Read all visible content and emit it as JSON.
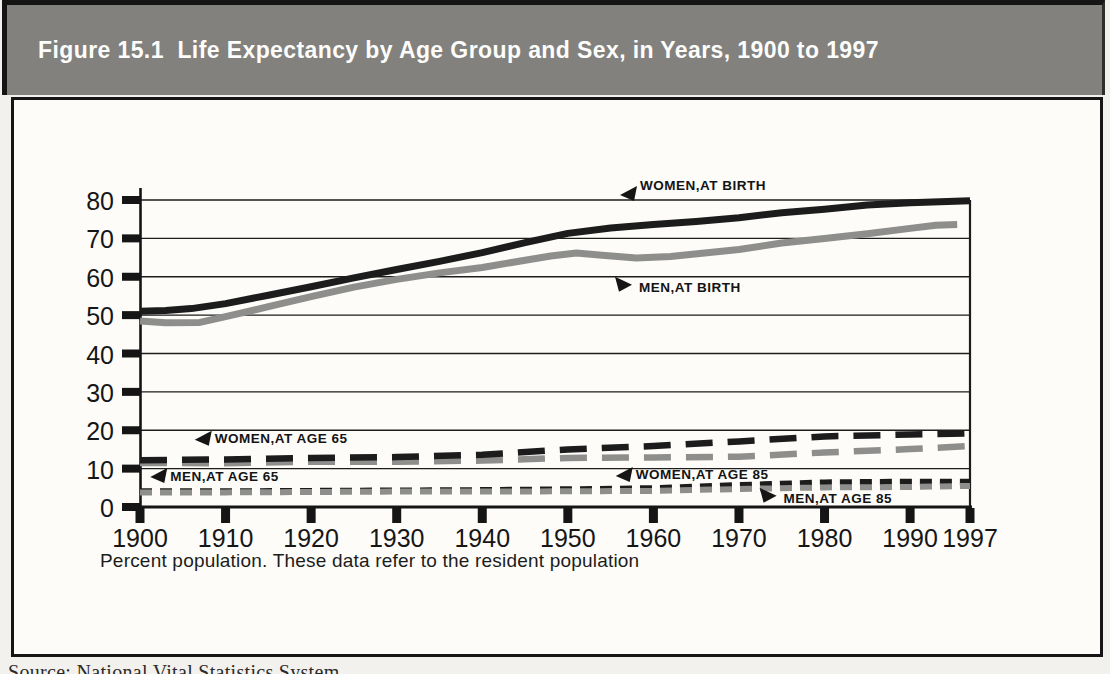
{
  "figure": {
    "title": "Figure 15.1  Life Expectancy by Age Group and Sex, in Years, 1900 to 1997",
    "footnote": "Percent population. These data refer to the resident population",
    "source_caption": "Source: National Vital Statistics System",
    "colors": {
      "band_gray": "#82817e",
      "line_black": "#1c1c1c",
      "line_gray": "#8e8e8c",
      "frame_black": "#151515"
    }
  },
  "chart_data": {
    "type": "line",
    "title": "Life Expectancy by Age Group and Sex, in Years, 1900 to 1997",
    "xlabel": "",
    "ylabel": "",
    "xlim": [
      1900,
      1997
    ],
    "ylim": [
      0,
      80
    ],
    "x_ticks": [
      1900,
      1910,
      1920,
      1930,
      1940,
      1950,
      1960,
      1970,
      1980,
      1990,
      1997
    ],
    "y_ticks": [
      0,
      10,
      20,
      30,
      40,
      50,
      60,
      70,
      80
    ],
    "grid": "horizontal gridlines at every 10 years of life expectancy",
    "legend_position": "inline annotations with arrows",
    "series": [
      {
        "id": "women-at-85",
        "name": "WOMEN,AT AGE 85",
        "color": "black",
        "style": "short-dash",
        "width": 6,
        "points": [
          [
            1900,
            4.1
          ],
          [
            1910,
            4.1
          ],
          [
            1920,
            4.2
          ],
          [
            1930,
            4.3
          ],
          [
            1940,
            4.4
          ],
          [
            1950,
            4.6
          ],
          [
            1960,
            4.9
          ],
          [
            1970,
            5.7
          ],
          [
            1980,
            6.4
          ],
          [
            1990,
            6.6
          ],
          [
            1997,
            6.6
          ]
        ]
      },
      {
        "id": "men-at-85",
        "name": "MEN,AT AGE 85",
        "color": "gray",
        "style": "short-dash",
        "width": 6,
        "points": [
          [
            1900,
            3.8
          ],
          [
            1910,
            3.8
          ],
          [
            1920,
            3.9
          ],
          [
            1930,
            4.0
          ],
          [
            1940,
            4.0
          ],
          [
            1950,
            4.1
          ],
          [
            1960,
            4.2
          ],
          [
            1970,
            4.7
          ],
          [
            1980,
            5.1
          ],
          [
            1990,
            5.2
          ],
          [
            1997,
            5.5
          ]
        ]
      },
      {
        "id": "men-at-65",
        "name": "MEN,AT AGE 65",
        "color": "gray",
        "style": "long-dash",
        "width": 6.5,
        "points": [
          [
            1900,
            11.5
          ],
          [
            1910,
            11.4
          ],
          [
            1920,
            11.8
          ],
          [
            1930,
            11.8
          ],
          [
            1940,
            12.1
          ],
          [
            1950,
            12.8
          ],
          [
            1960,
            12.9
          ],
          [
            1970,
            13.1
          ],
          [
            1980,
            14.2
          ],
          [
            1990,
            15.1
          ],
          [
            1997,
            15.9
          ]
        ]
      },
      {
        "id": "women-at-65",
        "name": "WOMEN,AT AGE 65",
        "color": "black",
        "style": "long-dash",
        "width": 6.5,
        "points": [
          [
            1900,
            12.2
          ],
          [
            1910,
            12.4
          ],
          [
            1920,
            12.8
          ],
          [
            1930,
            13.0
          ],
          [
            1940,
            13.6
          ],
          [
            1950,
            15.0
          ],
          [
            1960,
            15.9
          ],
          [
            1970,
            17.1
          ],
          [
            1980,
            18.4
          ],
          [
            1990,
            18.9
          ],
          [
            1997,
            19.2
          ]
        ]
      },
      {
        "id": "men-at-birth",
        "name": "MEN,AT BIRTH",
        "color": "gray",
        "style": "solid",
        "width": 7,
        "points": [
          [
            1900,
            48.5
          ],
          [
            1903,
            48.0
          ],
          [
            1907,
            48.1
          ],
          [
            1910,
            49.6
          ],
          [
            1915,
            52.2
          ],
          [
            1920,
            54.8
          ],
          [
            1925,
            57.3
          ],
          [
            1930,
            59.3
          ],
          [
            1935,
            61.0
          ],
          [
            1940,
            62.4
          ],
          [
            1945,
            64.3
          ],
          [
            1948,
            65.4
          ],
          [
            1951,
            66.2
          ],
          [
            1954,
            65.6
          ],
          [
            1958,
            64.9
          ],
          [
            1962,
            65.3
          ],
          [
            1966,
            66.2
          ],
          [
            1970,
            67.1
          ],
          [
            1975,
            68.8
          ],
          [
            1980,
            70.0
          ],
          [
            1985,
            71.2
          ],
          [
            1990,
            72.6
          ],
          [
            1993,
            73.4
          ],
          [
            1995.5,
            73.6
          ]
        ]
      },
      {
        "id": "women-at-birth",
        "name": "WOMEN,AT BIRTH",
        "color": "black",
        "style": "solid",
        "width": 7,
        "points": [
          [
            1900,
            51.0
          ],
          [
            1903,
            51.2
          ],
          [
            1906,
            51.7
          ],
          [
            1910,
            53.0
          ],
          [
            1915,
            55.2
          ],
          [
            1920,
            57.4
          ],
          [
            1925,
            59.7
          ],
          [
            1930,
            61.9
          ],
          [
            1935,
            64.0
          ],
          [
            1940,
            66.3
          ],
          [
            1945,
            68.9
          ],
          [
            1950,
            71.3
          ],
          [
            1955,
            72.7
          ],
          [
            1960,
            73.6
          ],
          [
            1965,
            74.4
          ],
          [
            1970,
            75.4
          ],
          [
            1975,
            76.7
          ],
          [
            1980,
            77.6
          ],
          [
            1985,
            78.7
          ],
          [
            1990,
            79.3
          ],
          [
            1997,
            79.8
          ]
        ]
      }
    ],
    "annotations": [
      {
        "label": "WOMEN,AT BIRTH",
        "dir": "left",
        "year": 1956.1,
        "value": 81.3,
        "text_dy": -10
      },
      {
        "label": "MEN,AT BIRTH",
        "dir": "right",
        "year": 1957.5,
        "value": 57.9,
        "text_dy": 3
      },
      {
        "label": "WOMEN,AT AGE 65",
        "dir": "left",
        "year": 1906.4,
        "value": 17.5,
        "text_dy": -1
      },
      {
        "label": "MEN,AT AGE 65",
        "dir": "left",
        "year": 1901.2,
        "value": 7.8,
        "text_dy": -1
      },
      {
        "label": "WOMEN,AT AGE 85",
        "dir": "left",
        "year": 1955.6,
        "value": 8.1,
        "text_dy": -1
      },
      {
        "label": "MEN,AT AGE 85",
        "dir": "right",
        "year": 1974.4,
        "value": 2.9,
        "text_dy": 3
      }
    ]
  }
}
